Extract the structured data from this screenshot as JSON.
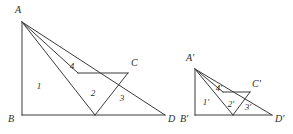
{
  "diagram": {
    "stroke_color": "#3a3a3a",
    "text_color": "#2b2b2b",
    "background_color": "#ffffff",
    "figures": [
      {
        "name": "left-figure",
        "vertex_labels": {
          "a": "A",
          "b": "B",
          "c": "C",
          "d": "D"
        },
        "region_labels": {
          "r1": "1",
          "r2": "2",
          "r3": "3",
          "r4": "4"
        },
        "vertex_points": {
          "A": [
            22,
            22
          ],
          "B": [
            22,
            115
          ],
          "C": [
            128,
            73
          ],
          "D": [
            165,
            115
          ],
          "E": [
            95,
            115
          ],
          "F": [
            78,
            73
          ]
        },
        "label_positions": {
          "A": [
            18,
            13
          ],
          "B": [
            11,
            122
          ],
          "C": [
            131,
            66
          ],
          "D": [
            168,
            122
          ],
          "r1": [
            39,
            89
          ],
          "r2": [
            93,
            95
          ],
          "r3": [
            121,
            100
          ],
          "r4": [
            71,
            69
          ]
        }
      },
      {
        "name": "right-figure",
        "vertex_labels": {
          "a": "A'",
          "b": "B'",
          "c": "C'",
          "d": "D'"
        },
        "region_labels": {
          "r1": "1'",
          "r2": "2'",
          "r3": "3'",
          "r4": "4'"
        },
        "vertex_points": {
          "A": [
            195,
            69
          ],
          "B": [
            195,
            115
          ],
          "C": [
            250,
            92
          ],
          "D": [
            272,
            115
          ],
          "E": [
            233,
            115
          ],
          "F": [
            223,
            92
          ]
        },
        "label_positions": {
          "A": [
            190,
            61
          ],
          "B": [
            184,
            122
          ],
          "C": [
            252,
            87
          ],
          "D": [
            275,
            122
          ],
          "r1": [
            205,
            103
          ],
          "r2": [
            231,
            105
          ],
          "r3": [
            248,
            108
          ],
          "r4": [
            218,
            91
          ]
        }
      }
    ]
  }
}
